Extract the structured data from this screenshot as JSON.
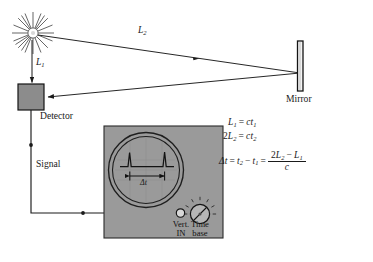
{
  "figure": {
    "background_color": "#ffffff",
    "ink_color": "#1a1a1a",
    "panel_fill": "#9a9a9a",
    "detector_fill": "#8c8c8c",
    "mirror_fill": "#f2f2f2"
  },
  "labels": {
    "path_short": "L",
    "path_short_sub": "1",
    "path_long": "L",
    "path_long_sub": "2",
    "detector": "Detector",
    "mirror": "Mirror",
    "signal": "Signal",
    "delta_t": "Δt"
  },
  "oscilloscope": {
    "vert_in_line1": "Vert.",
    "vert_in_line2": "IN",
    "time_base_line1": "Time",
    "time_base_line2": "base",
    "screen_delta_label": "Δt",
    "pulse_count": 2
  },
  "equations": {
    "eq1": {
      "lhs_var": "L",
      "lhs_sub": "1",
      "eq": "=",
      "rhs_var": "c",
      "rhs_t": "t",
      "rhs_sub": "1",
      "plain": "L1 = ct1"
    },
    "eq2": {
      "coeff": "2",
      "lhs_var": "L",
      "lhs_sub": "2",
      "eq": "=",
      "rhs_var": "c",
      "rhs_t": "t",
      "rhs_sub": "2",
      "plain": "2L2 = ct2"
    },
    "eq3": {
      "delta": "Δt",
      "eq1": "=",
      "t_a": "t",
      "t_a_sub": "2",
      "minus": "−",
      "t_b": "t",
      "t_b_sub": "1",
      "eq2": "=",
      "num_coeff": "2",
      "num_var_a": "L",
      "num_sub_a": "2",
      "num_minus": "−",
      "num_var_b": "L",
      "num_sub_b": "1",
      "den": "c",
      "plain": "Δt = t2 − t1 = (2L2 − L1)/c"
    }
  }
}
